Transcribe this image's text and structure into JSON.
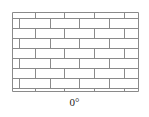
{
  "figure": {
    "label": "0°",
    "wall": {
      "left": 12,
      "top": 12,
      "right": 138,
      "bottom": 91,
      "line_color": "#8a8a8a",
      "rows": [
        {
          "y0": 12,
          "y1": 18,
          "joints": [
            35,
            64,
            94,
            124
          ]
        },
        {
          "y0": 18,
          "y1": 28,
          "joints": [
            19,
            50,
            79,
            109
          ]
        },
        {
          "y0": 28,
          "y1": 38,
          "joints": [
            35,
            64,
            94,
            124
          ]
        },
        {
          "y0": 38,
          "y1": 48,
          "joints": [
            19,
            50,
            79,
            109
          ]
        },
        {
          "y0": 48,
          "y1": 58,
          "joints": [
            35,
            64,
            94,
            124
          ]
        },
        {
          "y0": 58,
          "y1": 68,
          "joints": [
            19,
            50,
            79,
            109
          ]
        },
        {
          "y0": 68,
          "y1": 78,
          "joints": [
            35,
            64,
            94,
            124
          ]
        },
        {
          "y0": 78,
          "y1": 88,
          "joints": [
            19,
            50,
            79,
            109
          ]
        },
        {
          "y0": 88,
          "y1": 91,
          "joints": [
            35,
            64,
            94,
            124
          ]
        }
      ]
    }
  }
}
